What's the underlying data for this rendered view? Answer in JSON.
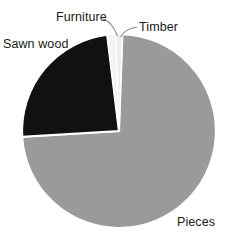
{
  "chart_data": {
    "type": "pie",
    "title": "",
    "categories": [
      "Pieces",
      "Sawn wood",
      "Furniture",
      "Timber"
    ],
    "values": [
      73.5,
      24.0,
      1.4,
      1.1
    ],
    "unit": "percent",
    "legend": "none",
    "labels_position": "outside-with-leader-lines",
    "grid": false,
    "slices": [
      {
        "name": "Pieces",
        "label": "Pieces",
        "value": 73.5,
        "color": "#9a9a9a",
        "start_angle_deg": 2.0,
        "end_angle_deg": 166.6,
        "has_leader_line": false
      },
      {
        "name": "Sawn wood",
        "label": "Sawn wood",
        "value": 24.0,
        "color": "#111111",
        "start_angle_deg": 166.6,
        "end_angle_deg": 353.0,
        "has_leader_line": false
      },
      {
        "name": "Furniture",
        "label": "Furniture",
        "value": 1.4,
        "color": "#f2f2f2",
        "start_angle_deg": 353.0,
        "end_angle_deg": 358.0,
        "has_leader_line": true
      },
      {
        "name": "Timber",
        "label": "Timber",
        "value": 1.1,
        "color": "#ededed",
        "start_angle_deg": 358.0,
        "end_angle_deg": 362.0,
        "has_leader_line": true
      }
    ]
  },
  "geometry": {
    "center_x": 119,
    "center_y": 131,
    "radius": 97
  },
  "colors": {
    "background": "#ffffff",
    "pieces": "#9a9a9a",
    "sawn_wood": "#111111",
    "furniture": "#f2f2f2",
    "timber": "#ededed",
    "separator": "#ffffff",
    "leader_line": "#8a8a8a",
    "text": "#1a1a1a"
  },
  "labels": {
    "furniture": "Furniture",
    "timber": "Timber",
    "sawn_wood": "Sawn wood",
    "pieces": "Pieces"
  }
}
